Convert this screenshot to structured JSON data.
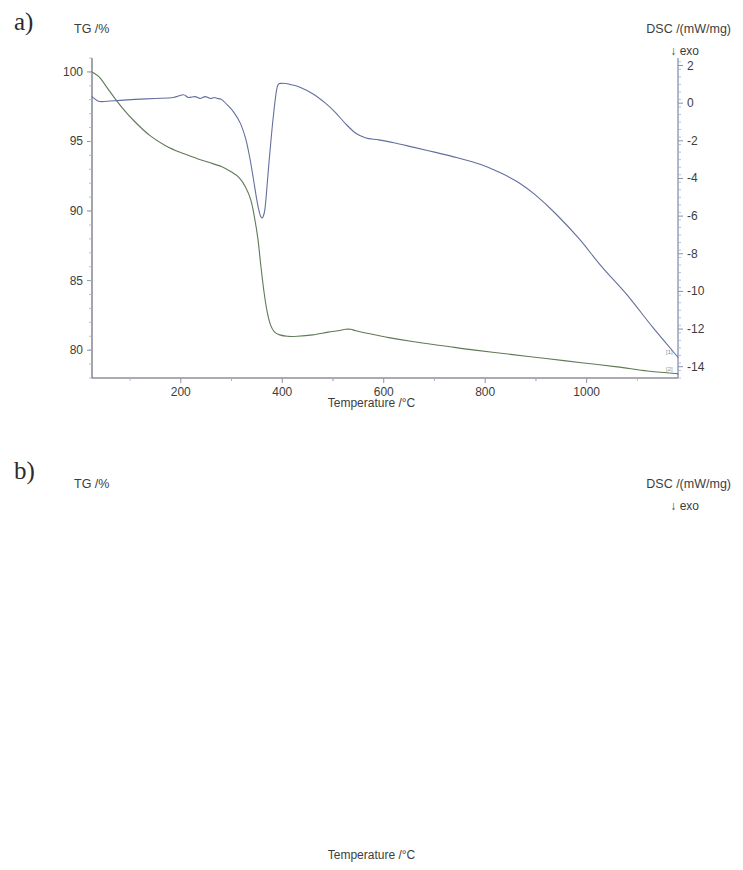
{
  "figure": {
    "panels": [
      {
        "tag": "a)",
        "left_axis_title": "TG /%",
        "right_axis_title": "DSC /(mW/mg)",
        "exo_note": "↓ exo",
        "x_axis_title": "Temperature /°C"
      },
      {
        "tag": "b)",
        "left_axis_title": "TG /%",
        "right_axis_title": "DSC /(mW/mg)",
        "exo_note": "↓ exo",
        "x_axis_title": "Temperature /°C"
      }
    ],
    "curve_markers": {
      "tg": "[2]",
      "dsc": "[1]"
    },
    "colors": {
      "tg_curve": "#5f7a55",
      "dsc_curve": "#646f9e",
      "axis": "#6f7aa8",
      "text": "#3d3d3d"
    }
  },
  "chart_data": [
    {
      "type": "line",
      "panel": "a",
      "title": "",
      "xlabel": "Temperature /°C",
      "xlim": [
        25,
        1180
      ],
      "xticks": [
        200,
        400,
        600,
        800,
        1000
      ],
      "grid": false,
      "legend": "none",
      "axes": [
        {
          "id": "left",
          "label": "TG /%",
          "ylim": [
            78,
            101
          ],
          "yticks": [
            80,
            85,
            90,
            95,
            100
          ]
        },
        {
          "id": "right",
          "label": "DSC /(mW/mg)",
          "ylim": [
            -14.6,
            2.4
          ],
          "yticks": [
            2,
            0,
            -2,
            -4,
            -6,
            -8,
            -10,
            -12,
            -14
          ]
        }
      ],
      "series": [
        {
          "name": "TG",
          "axis": "left",
          "color": "#5f7a55",
          "marker": "[2]",
          "x": [
            25,
            40,
            60,
            85,
            110,
            140,
            170,
            200,
            230,
            255,
            280,
            300,
            315,
            328,
            338,
            345,
            352,
            358,
            364,
            370,
            377,
            385,
            395,
            410,
            430,
            460,
            490,
            510,
            525,
            535,
            545,
            570,
            610,
            660,
            720,
            780,
            850,
            920,
            990,
            1060,
            1120,
            1180
          ],
          "values": [
            100.0,
            99.6,
            98.6,
            97.4,
            96.4,
            95.4,
            94.7,
            94.2,
            93.8,
            93.5,
            93.2,
            92.8,
            92.4,
            91.7,
            90.8,
            89.6,
            88.0,
            86.0,
            84.2,
            82.8,
            81.8,
            81.3,
            81.1,
            81.0,
            81.0,
            81.1,
            81.3,
            81.4,
            81.5,
            81.5,
            81.4,
            81.2,
            80.9,
            80.6,
            80.3,
            80.0,
            79.7,
            79.4,
            79.1,
            78.8,
            78.5,
            78.3
          ]
        },
        {
          "name": "DSC",
          "axis": "right",
          "color": "#646f9e",
          "marker": "[1]",
          "x": [
            25,
            38,
            55,
            80,
            110,
            150,
            185,
            205,
            215,
            228,
            238,
            248,
            258,
            266,
            272,
            280,
            292,
            305,
            318,
            328,
            336,
            343,
            349,
            354,
            358,
            362,
            366,
            370,
            375,
            382,
            390,
            400,
            415,
            435,
            460,
            485,
            505,
            525,
            545,
            565,
            590,
            620,
            660,
            700,
            745,
            790,
            830,
            865,
            900,
            940,
            985,
            1030,
            1080,
            1130,
            1180
          ],
          "values": [
            0.35,
            0.1,
            0.1,
            0.15,
            0.2,
            0.25,
            0.3,
            0.45,
            0.3,
            0.35,
            0.25,
            0.35,
            0.25,
            0.3,
            0.25,
            0.2,
            -0.1,
            -0.5,
            -1.1,
            -1.9,
            -2.9,
            -4.0,
            -5.0,
            -5.7,
            -6.05,
            -6.05,
            -5.6,
            -4.4,
            -2.8,
            -0.8,
            0.85,
            1.05,
            1.0,
            0.85,
            0.5,
            0.0,
            -0.5,
            -1.1,
            -1.6,
            -1.85,
            -1.95,
            -2.1,
            -2.35,
            -2.6,
            -2.9,
            -3.25,
            -3.7,
            -4.2,
            -4.9,
            -5.9,
            -7.2,
            -8.7,
            -10.2,
            -11.9,
            -13.5
          ]
        }
      ]
    },
    {
      "type": "line",
      "panel": "b",
      "title": "",
      "xlabel": "Temperature /°C",
      "xlim": [
        25,
        980
      ],
      "xticks": [
        100,
        200,
        300,
        400,
        500,
        600,
        700,
        800,
        900
      ],
      "grid": false,
      "legend": "none",
      "axes": [
        {
          "id": "left",
          "label": "TG /%",
          "ylim": [
            63.0,
            101.2
          ],
          "yticks": [
            65,
            70,
            75,
            80,
            85,
            90,
            95,
            100
          ]
        },
        {
          "id": "right",
          "label": "DSC /(mW/mg)",
          "ylim": [
            -7.55,
            0.45
          ],
          "yticks": [
            0,
            -1,
            -2,
            -3,
            -4,
            -5,
            -6,
            -7
          ]
        }
      ],
      "series": [
        {
          "name": "TG",
          "axis": "left",
          "color": "#5f7a55",
          "marker": "[2]",
          "x": [
            25,
            45,
            70,
            100,
            130,
            160,
            185,
            205,
            225,
            245,
            265,
            285,
            300,
            315,
            330,
            345,
            360,
            375,
            390,
            405,
            420,
            435,
            450,
            462,
            472,
            480,
            490,
            510,
            545,
            600,
            660,
            720,
            780,
            840,
            900,
            950,
            980
          ],
          "values": [
            100.0,
            99.5,
            98.6,
            97.5,
            96.6,
            95.8,
            95.2,
            94.9,
            94.6,
            94.3,
            93.9,
            93.2,
            92.5,
            91.5,
            90.2,
            88.6,
            86.7,
            84.5,
            82.0,
            79.3,
            76.4,
            73.4,
            70.4,
            68.2,
            66.5,
            65.4,
            64.8,
            64.6,
            64.6,
            64.6,
            64.6,
            64.6,
            64.65,
            64.7,
            64.75,
            64.8,
            64.85
          ]
        },
        {
          "name": "DSC",
          "axis": "right",
          "color": "#646f9e",
          "marker": "[1]",
          "x": [
            25,
            40,
            60,
            85,
            110,
            130,
            150,
            163,
            170,
            176,
            182,
            190,
            200,
            212,
            225,
            240,
            255,
            270,
            285,
            300,
            315,
            330,
            345,
            360,
            375,
            390,
            402,
            415,
            428,
            440,
            450,
            458,
            464,
            468,
            472,
            476,
            480,
            484,
            488,
            492,
            500,
            515,
            530,
            545,
            556,
            565,
            580,
            600,
            630,
            665,
            700,
            730,
            760,
            790,
            820,
            850,
            880,
            905,
            930,
            950,
            965,
            980
          ],
          "values": [
            -0.02,
            0.04,
            0.05,
            0.02,
            -0.05,
            -0.15,
            -0.3,
            -0.42,
            -0.35,
            -0.5,
            -0.62,
            -0.7,
            -0.8,
            -0.92,
            -1.05,
            -1.25,
            -1.5,
            -1.82,
            -2.2,
            -2.65,
            -3.15,
            -3.7,
            -4.25,
            -4.8,
            -5.3,
            -5.75,
            -6.1,
            -6.45,
            -6.75,
            -6.98,
            -7.15,
            -7.25,
            -7.3,
            -7.32,
            -7.33,
            -7.3,
            -7.2,
            -6.6,
            -5.3,
            -3.9,
            -2.55,
            -2.48,
            -2.55,
            -2.62,
            -2.58,
            -2.66,
            -2.68,
            -2.68,
            -2.68,
            -2.68,
            -2.67,
            -2.69,
            -2.72,
            -2.76,
            -2.8,
            -2.85,
            -2.92,
            -3.0,
            -3.08,
            -3.15,
            -3.2,
            -3.23
          ]
        }
      ]
    }
  ]
}
